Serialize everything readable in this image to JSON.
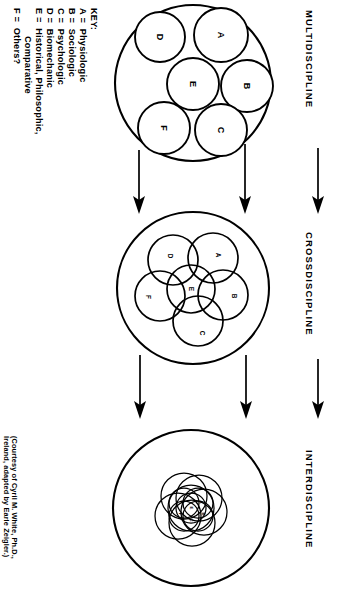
{
  "figure": {
    "orientation": "rotated-90",
    "caption_line1": "(Courtesy of Cyril M. White, Ph.D.,",
    "caption_line2": "Ireland, adapted by Earle Zeigler.)"
  },
  "key": {
    "heading": "KEY:",
    "entries": [
      {
        "code": "A",
        "eq": "=",
        "label": "Physiologic"
      },
      {
        "code": "B",
        "eq": "=",
        "label": "Sociologic"
      },
      {
        "code": "C",
        "eq": "=",
        "label": "Psychologic"
      },
      {
        "code": "D",
        "eq": "=",
        "label": "Biomechanic"
      },
      {
        "code": "E",
        "eq": "=",
        "label": "Historical, Philosophic,"
      },
      {
        "code": "",
        "eq": "",
        "label": "Comparative"
      },
      {
        "code": "F",
        "eq": "=",
        "label": "Others?"
      }
    ]
  },
  "stages": [
    {
      "id": "multidiscipline",
      "label": "MULTIDISCIPLINE",
      "arrangement": "separate",
      "members": [
        "A",
        "B",
        "C",
        "D",
        "E",
        "F"
      ]
    },
    {
      "id": "crossdiscipline",
      "label": "CROSSDISCIPLINE",
      "arrangement": "overlapping",
      "members": [
        "A",
        "B",
        "C",
        "D",
        "E",
        "F"
      ]
    },
    {
      "id": "interdiscipline",
      "label": "INTERDISCIPLINE",
      "arrangement": "fused",
      "members": [
        "A",
        "B",
        "C",
        "D",
        "E",
        "F"
      ]
    }
  ],
  "flow": {
    "arrow_count_per_gap": 2,
    "side_arrow": "down-arrow"
  }
}
